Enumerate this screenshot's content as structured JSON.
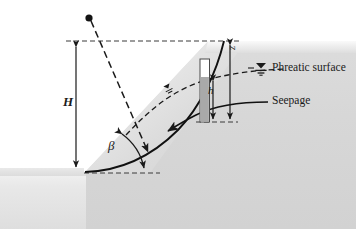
{
  "figure": {
    "type": "engineering-cross-section",
    "background_color": "#ffffff"
  },
  "labels": {
    "phreatic_surface": "Phreatic surface",
    "seepage": "Seepage",
    "slope_height": "H",
    "slope_angle": "β",
    "pressure_head": "h",
    "depth": "z"
  },
  "colors": {
    "soil_body": "#d6d6d6",
    "soil_body_light": "#eaeaea",
    "slope_face_light": "#f2f2f2",
    "ground_band": "#efefef",
    "line": "#1a1a1a",
    "piezometer_water": "#a9a9a9",
    "piezometer_tube": "#ffffff",
    "dashed": "#333333"
  },
  "geometry": {
    "crest_level_y": 41,
    "toe_level_y": 173,
    "toe_x": 84,
    "crest_x": 208,
    "slope_angle_deg": 47,
    "source_point": {
      "x": 89,
      "y": 18
    },
    "piezometer": {
      "x": 200,
      "width": 9,
      "top_y": 59,
      "bottom_y": 122,
      "water_top_y": 77
    }
  },
  "icons": {
    "water_table_legend": "water-table-symbol",
    "water_table_slope": "water-table-symbol-small",
    "source_point": "filled-circle-marker"
  },
  "annotations": {
    "dimension_H": "vertical double-headed arrow between crest level and toe level",
    "dimension_z": "vertical double-headed arrow from crest level down to failure surface",
    "dimension_h": "vertical double-headed arrow from phreatic surface down to failure surface",
    "angle_beta": "curved double-headed arc between slope face and horizontal at toe",
    "failure_surface": "solid curved arc from toe up through crest region",
    "phreatic_line": "dashed curve following groundwater table",
    "seepage_arrow": "arrow pointing down-left along seepage direction",
    "dashed_ray": "dashed straight line from source point through slope to failure surface"
  }
}
